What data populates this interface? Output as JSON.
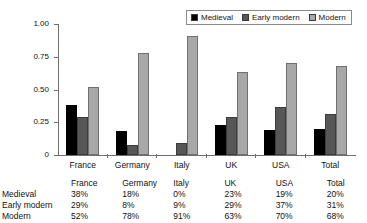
{
  "chart_data": {
    "type": "bar",
    "title": "",
    "xlabel": "",
    "ylabel": "",
    "categories": [
      "France",
      "Germany",
      "Italy",
      "UK",
      "USA",
      "Total"
    ],
    "series": [
      {
        "name": "Medieval",
        "color": "#000000",
        "values": [
          0.38,
          0.18,
          0.0,
          0.23,
          0.19,
          0.2
        ]
      },
      {
        "name": "Early modern",
        "color": "#575757",
        "values": [
          0.29,
          0.08,
          0.09,
          0.29,
          0.37,
          0.31
        ]
      },
      {
        "name": "Modern",
        "color": "#a8a8a8",
        "values": [
          0.52,
          0.78,
          0.91,
          0.63,
          0.7,
          0.68
        ]
      }
    ],
    "ylim": [
      0,
      1.0
    ],
    "ytick_labels": [
      "1.00",
      "0.75",
      "0.50",
      "0.25",
      "0"
    ],
    "ytick_values": [
      1.0,
      0.75,
      0.5,
      0.25,
      0
    ],
    "grid": false,
    "legend_position": "top-right"
  },
  "legend": {
    "items": [
      {
        "label": "Medieval"
      },
      {
        "label": "Early modern"
      },
      {
        "label": "Modern"
      }
    ]
  },
  "table": {
    "columns": [
      "",
      "France",
      "Germany",
      "Italy",
      "UK",
      "USA",
      "Total"
    ],
    "rows": [
      {
        "label": "Medieval",
        "values": [
          "38%",
          "18%",
          "0%",
          "23%",
          "19%",
          "20%"
        ]
      },
      {
        "label": "Early modern",
        "values": [
          "29%",
          "8%",
          "9%",
          "29%",
          "37%",
          "31%"
        ]
      },
      {
        "label": "Modern",
        "values": [
          "52%",
          "78%",
          "91%",
          "63%",
          "70%",
          "68%"
        ]
      }
    ]
  }
}
